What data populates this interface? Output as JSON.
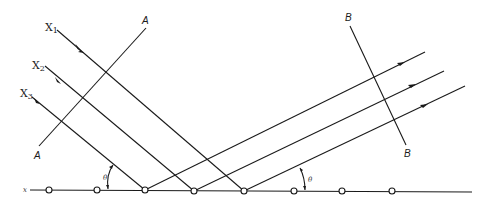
{
  "diagram": {
    "incident_rays": [
      {
        "label": "X",
        "sub": "1"
      },
      {
        "label": "X",
        "sub": "2"
      },
      {
        "label": "X",
        "sub": "3"
      }
    ],
    "wavefront_incident": {
      "top_label": "A",
      "bottom_label": "A"
    },
    "wavefront_diffracted": {
      "top_label": "B",
      "bottom_label": "B"
    },
    "row_label": "x",
    "angle_label": "θ",
    "atom_count": 8
  }
}
